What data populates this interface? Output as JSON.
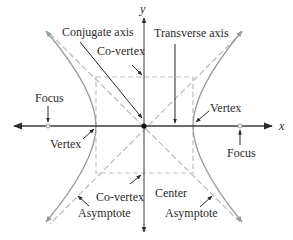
{
  "figure": {
    "colors": {
      "axis": "#3a3a3a",
      "curve": "#9a9a9a",
      "dashed": "#bdbdbd",
      "pointer": "#2a2a2a",
      "text": "#2a2a2a"
    },
    "axes": {
      "x_label": "x",
      "y_label": "y"
    },
    "labels": {
      "conjugate_axis": "Conjugate axis",
      "transverse_axis": "Transverse axis",
      "co_vertex_top": "Co-vertex",
      "co_vertex_bottom": "Co-vertex",
      "focus_left": "Focus",
      "focus_right": "Focus",
      "vertex_left": "Vertex",
      "vertex_right": "Vertex",
      "center": "Center",
      "asymptote_left": "Asymptote",
      "asymptote_right": "Asymptote"
    }
  }
}
